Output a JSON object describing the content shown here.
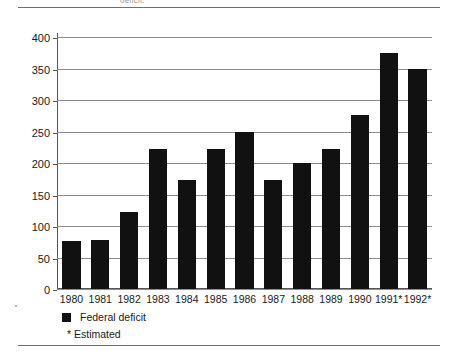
{
  "top_caption": "deficit.",
  "chart_data": {
    "type": "bar",
    "title": "",
    "xlabel": "",
    "ylabel": "",
    "ylim": [
      0,
      400
    ],
    "yticks": [
      0,
      50,
      100,
      150,
      200,
      250,
      300,
      350,
      400
    ],
    "grid": true,
    "legend_position": "below-left",
    "bar_color": "#111111",
    "categories": [
      "1980",
      "1981",
      "1982",
      "1983",
      "1984",
      "1985",
      "1986",
      "1987",
      "1988",
      "1989",
      "1990",
      "1991*",
      "1992*"
    ],
    "values": [
      77,
      78,
      122,
      222,
      173,
      222,
      250,
      173,
      200,
      222,
      277,
      375,
      350
    ],
    "series": [
      {
        "name": "Federal deficit",
        "values": [
          77,
          78,
          122,
          222,
          173,
          222,
          250,
          173,
          200,
          222,
          277,
          375,
          350
        ]
      }
    ],
    "legend": [
      "Federal deficit"
    ],
    "annotations": [
      "* Estimated"
    ]
  },
  "legend": {
    "series_label": "Federal deficit",
    "footnote": "* Estimated"
  }
}
